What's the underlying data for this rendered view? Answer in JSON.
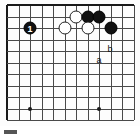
{
  "diagram": {
    "kind": "go-board-diagram",
    "board": {
      "origin_x": 7,
      "origin_y": 5,
      "spacing": 11.5,
      "cols": 12,
      "rows": 11,
      "top_edge": true,
      "left_edge": true,
      "line_color": "#4a4a4a",
      "edge_color": "#1a1a1a",
      "background": "#fdfdfd"
    },
    "hoshi": [
      {
        "name": "star-point-left",
        "col": 2,
        "row": 9
      },
      {
        "name": "star-point-right",
        "col": 8,
        "row": 9
      }
    ],
    "stones": [
      {
        "name": "black-stone-1",
        "color": "black",
        "col": 2,
        "row": 2,
        "label": "1"
      },
      {
        "name": "white-stone-upper-1",
        "color": "white",
        "col": 6,
        "row": 1,
        "label": ""
      },
      {
        "name": "black-stone-upper-1",
        "color": "black",
        "col": 7,
        "row": 1,
        "label": ""
      },
      {
        "name": "black-stone-upper-2",
        "color": "black",
        "col": 8,
        "row": 1,
        "label": ""
      },
      {
        "name": "white-stone-lower-1",
        "color": "white",
        "col": 5,
        "row": 2,
        "label": ""
      },
      {
        "name": "white-stone-lower-2",
        "color": "white",
        "col": 7,
        "row": 2,
        "label": ""
      },
      {
        "name": "black-stone-lower-1",
        "color": "black",
        "col": 9,
        "row": 2,
        "label": ""
      }
    ],
    "point_labels": [
      {
        "name": "point-label-b",
        "text": "b",
        "x": 110,
        "y": 49
      },
      {
        "name": "point-label-a",
        "text": "a",
        "x": 99,
        "y": 60
      }
    ]
  },
  "caption": {
    "bar": "",
    "text": ""
  }
}
